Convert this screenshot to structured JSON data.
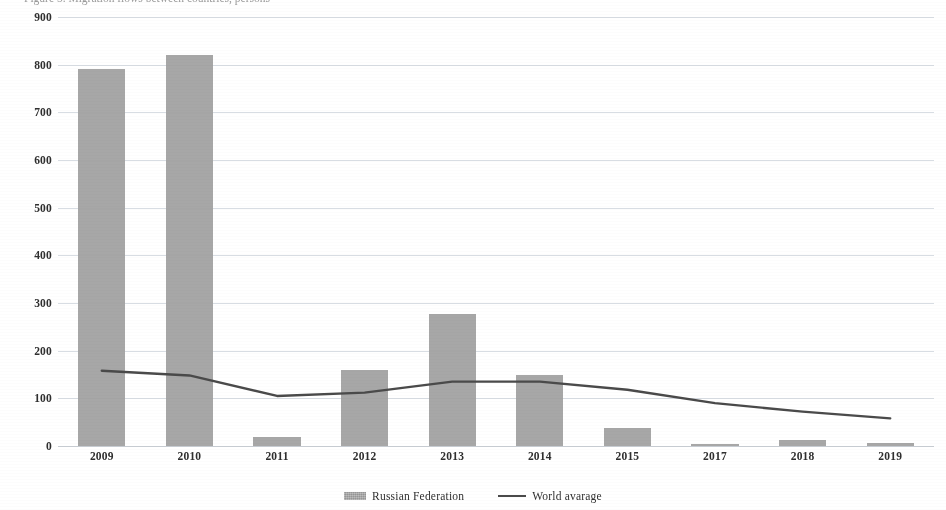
{
  "clipped_title": "Figure 5. Migration flows between countries, persons",
  "chart_data": {
    "type": "bar",
    "title": "",
    "xlabel": "",
    "ylabel": "",
    "ylim": [
      0,
      900
    ],
    "ytick_step": 100,
    "grid": true,
    "legend_position": "bottom-center",
    "categories": [
      "2009",
      "2010",
      "2011",
      "2012",
      "2013",
      "2014",
      "2015",
      "2017",
      "2018",
      "2019"
    ],
    "yticks": [
      "0",
      "100",
      "200",
      "300",
      "400",
      "500",
      "600",
      "700",
      "800",
      "900"
    ],
    "series": [
      {
        "name": "Russian Federation",
        "type": "bar",
        "color": "#a0a0a0",
        "values": [
          790,
          820,
          19,
          160,
          278,
          148,
          37,
          5,
          12,
          7
        ]
      },
      {
        "name": "World avarage",
        "type": "line",
        "color": "#4a4a4a",
        "values": [
          158,
          148,
          105,
          112,
          135,
          135,
          118,
          90,
          72,
          58
        ]
      }
    ]
  },
  "legend": {
    "items": [
      {
        "label": "Russian Federation",
        "marker": "bar-swatch"
      },
      {
        "label": "World avarage",
        "marker": "line-swatch"
      }
    ]
  }
}
